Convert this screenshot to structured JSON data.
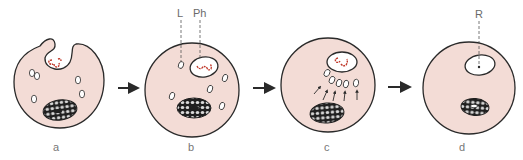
{
  "figure": {
    "colors": {
      "cytoplasm": "#f3dcd6",
      "outline": "#2a2a2a",
      "bacterium": "#c0392b",
      "vesicle_fill": "#ffffff",
      "nucleus_dark": "#1f1f1f",
      "nucleus_light": "#d8d8d8",
      "label_text": "#777777",
      "arrow": "#2a2a2a"
    },
    "panels": [
      {
        "id": "a",
        "label": "a"
      },
      {
        "id": "b",
        "label": "b"
      },
      {
        "id": "c",
        "label": "c"
      },
      {
        "id": "d",
        "label": "d"
      }
    ],
    "callouts": {
      "lysosome": "L",
      "phagosome": "Ph",
      "residual_body": "R"
    },
    "transition_arrows": 3
  }
}
